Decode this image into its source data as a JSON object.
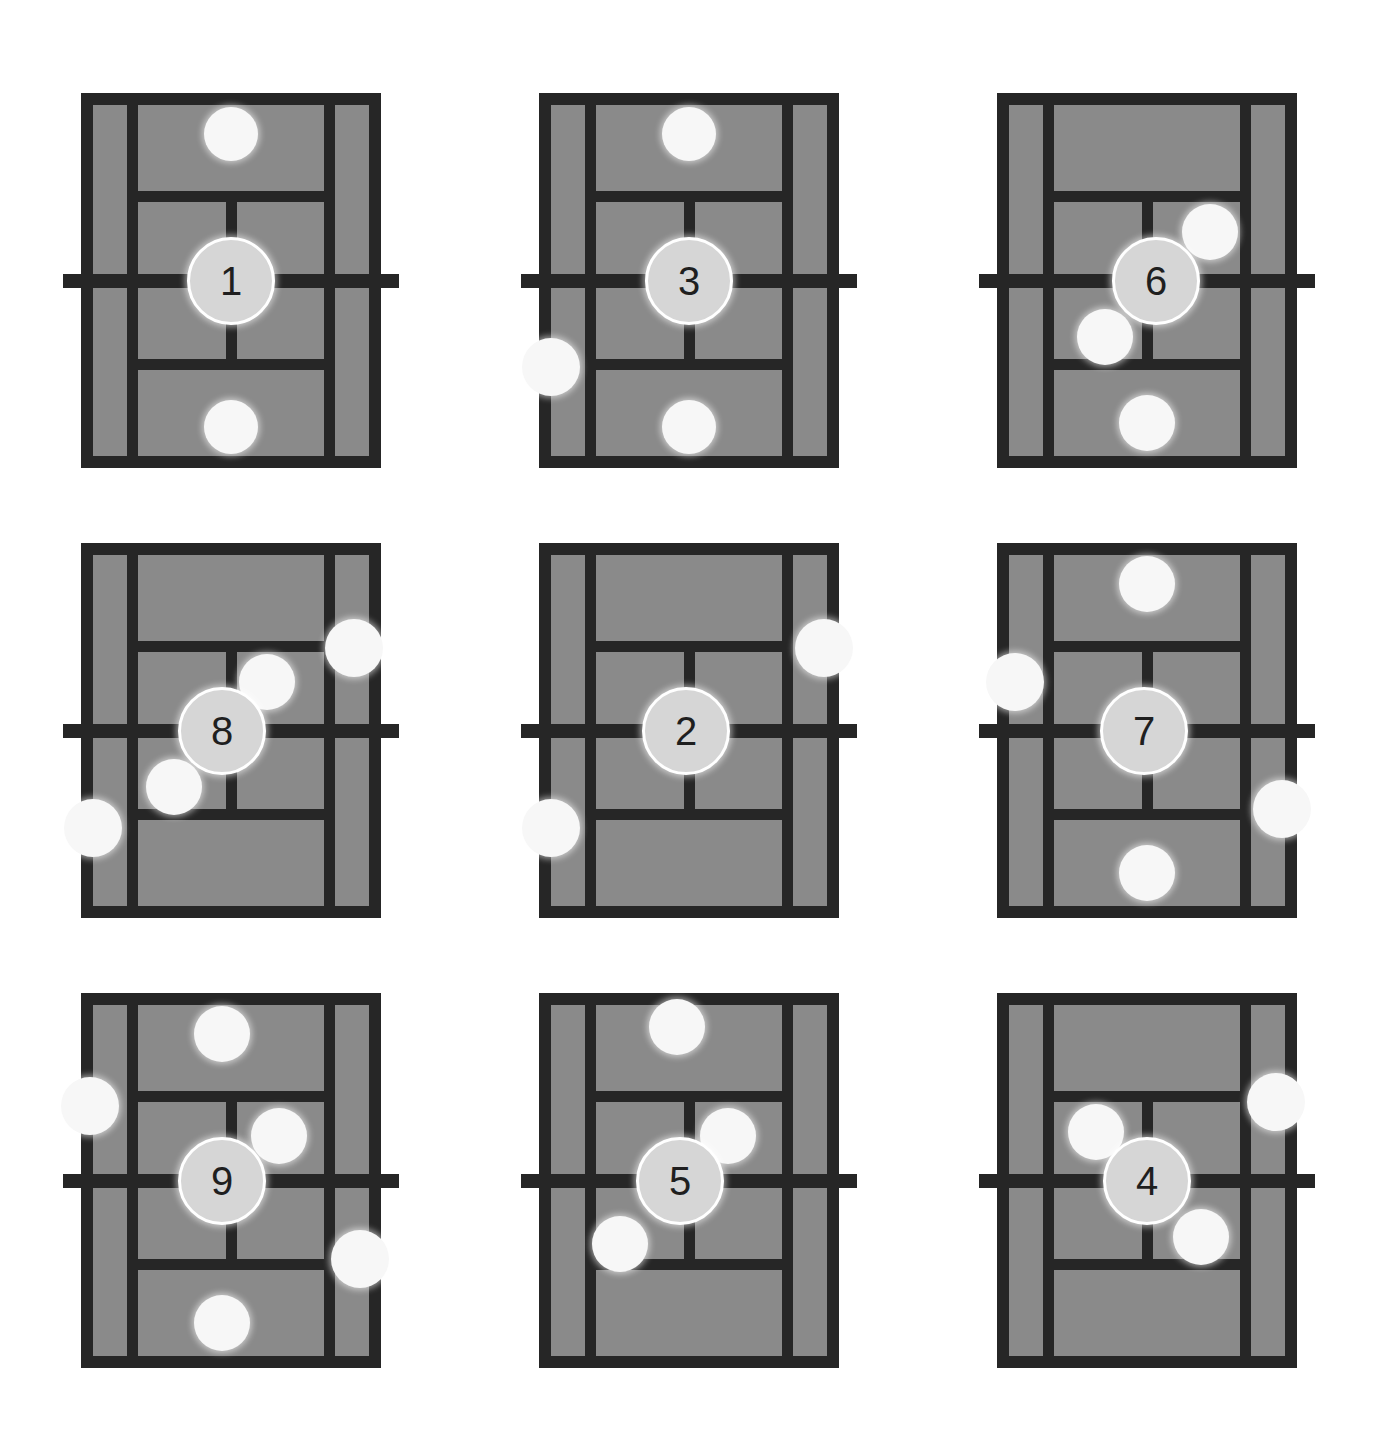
{
  "page": {
    "layout": "3x3",
    "background_color": "#ffffff"
  },
  "colors": {
    "court_fill": "#8a8a8a",
    "court_lines": "#262626",
    "marker_white": "#f7f7f7",
    "marker_numbered": "#d6d6d6",
    "number_text": "#1f1f1f"
  },
  "legend": {
    "big_circle_meaning": "numbered-marker",
    "small_circle_meaning": "plain-marker"
  },
  "panels": [
    {
      "id": "panel-1",
      "number": "1",
      "row": 1,
      "column": 1,
      "big_marker": {
        "x_pct": 50,
        "y_pct": 50,
        "size": 88
      },
      "small_markers": [
        {
          "x_pct": 50,
          "y_pct": 11,
          "size": 54
        },
        {
          "x_pct": 50,
          "y_pct": 89,
          "size": 54
        }
      ]
    },
    {
      "id": "panel-3",
      "number": "3",
      "row": 1,
      "column": 2,
      "big_marker": {
        "x_pct": 50,
        "y_pct": 50,
        "size": 88
      },
      "small_markers": [
        {
          "x_pct": 50,
          "y_pct": 11,
          "size": 54
        },
        {
          "x_pct": 50,
          "y_pct": 89,
          "size": 54
        },
        {
          "x_pct": 4,
          "y_pct": 73,
          "size": 58
        }
      ]
    },
    {
      "id": "panel-6",
      "number": "6",
      "row": 1,
      "column": 3,
      "big_marker": {
        "x_pct": 53,
        "y_pct": 50,
        "size": 88
      },
      "small_markers": [
        {
          "x_pct": 71,
          "y_pct": 37,
          "size": 56
        },
        {
          "x_pct": 36,
          "y_pct": 65,
          "size": 56
        },
        {
          "x_pct": 50,
          "y_pct": 88,
          "size": 56
        }
      ]
    },
    {
      "id": "panel-8",
      "number": "8",
      "row": 2,
      "column": 1,
      "big_marker": {
        "x_pct": 47,
        "y_pct": 50,
        "size": 88
      },
      "small_markers": [
        {
          "x_pct": 91,
          "y_pct": 28,
          "size": 58
        },
        {
          "x_pct": 62,
          "y_pct": 37,
          "size": 56
        },
        {
          "x_pct": 31,
          "y_pct": 65,
          "size": 56
        },
        {
          "x_pct": 4,
          "y_pct": 76,
          "size": 58
        }
      ]
    },
    {
      "id": "panel-2",
      "number": "2",
      "row": 2,
      "column": 2,
      "big_marker": {
        "x_pct": 49,
        "y_pct": 50,
        "size": 88
      },
      "small_markers": [
        {
          "x_pct": 95,
          "y_pct": 28,
          "size": 58
        },
        {
          "x_pct": 4,
          "y_pct": 76,
          "size": 58
        }
      ]
    },
    {
      "id": "panel-7",
      "number": "7",
      "row": 2,
      "column": 3,
      "big_marker": {
        "x_pct": 49,
        "y_pct": 50,
        "size": 88
      },
      "small_markers": [
        {
          "x_pct": 50,
          "y_pct": 11,
          "size": 56
        },
        {
          "x_pct": 6,
          "y_pct": 37,
          "size": 58
        },
        {
          "x_pct": 95,
          "y_pct": 71,
          "size": 58
        },
        {
          "x_pct": 50,
          "y_pct": 88,
          "size": 56
        }
      ]
    },
    {
      "id": "panel-9",
      "number": "9",
      "row": 3,
      "column": 1,
      "big_marker": {
        "x_pct": 47,
        "y_pct": 50,
        "size": 88
      },
      "small_markers": [
        {
          "x_pct": 47,
          "y_pct": 11,
          "size": 56
        },
        {
          "x_pct": 3,
          "y_pct": 30,
          "size": 58
        },
        {
          "x_pct": 66,
          "y_pct": 38,
          "size": 56
        },
        {
          "x_pct": 93,
          "y_pct": 71,
          "size": 58
        },
        {
          "x_pct": 47,
          "y_pct": 88,
          "size": 56
        }
      ]
    },
    {
      "id": "panel-5",
      "number": "5",
      "row": 3,
      "column": 2,
      "big_marker": {
        "x_pct": 47,
        "y_pct": 50,
        "size": 88
      },
      "small_markers": [
        {
          "x_pct": 46,
          "y_pct": 9,
          "size": 56
        },
        {
          "x_pct": 63,
          "y_pct": 38,
          "size": 56
        },
        {
          "x_pct": 27,
          "y_pct": 67,
          "size": 56
        }
      ]
    },
    {
      "id": "panel-4",
      "number": "4",
      "row": 3,
      "column": 3,
      "big_marker": {
        "x_pct": 50,
        "y_pct": 50,
        "size": 88
      },
      "small_markers": [
        {
          "x_pct": 93,
          "y_pct": 29,
          "size": 58
        },
        {
          "x_pct": 33,
          "y_pct": 37,
          "size": 56
        },
        {
          "x_pct": 68,
          "y_pct": 65,
          "size": 56
        }
      ]
    }
  ]
}
